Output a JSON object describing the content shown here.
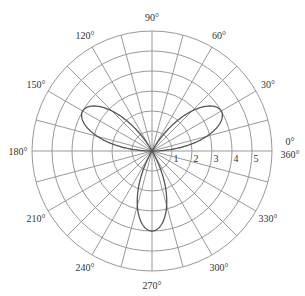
{
  "chart_data": {
    "type": "line",
    "subtype": "polar",
    "title": "",
    "equation": "r = 4 sin(3θ)",
    "series": [
      {
        "name": "rose curve",
        "petals": 3,
        "amplitude": 4,
        "petal_angles_deg": [
          30,
          150,
          270
        ],
        "color": "#555555"
      }
    ],
    "angular_axis": {
      "tick_step_deg": 15,
      "labels": [
        {
          "angle": 0,
          "text": "0°"
        },
        {
          "angle": 0,
          "text": "360°"
        },
        {
          "angle": 30,
          "text": "30°"
        },
        {
          "angle": 60,
          "text": "60°"
        },
        {
          "angle": 90,
          "text": "90°"
        },
        {
          "angle": 120,
          "text": "120°"
        },
        {
          "angle": 150,
          "text": "150°"
        },
        {
          "angle": 180,
          "text": "180°"
        },
        {
          "angle": 210,
          "text": "210°"
        },
        {
          "angle": 240,
          "text": "240°"
        },
        {
          "angle": 270,
          "text": "270°"
        },
        {
          "angle": 300,
          "text": "300°"
        },
        {
          "angle": 330,
          "text": "330°"
        }
      ]
    },
    "radial_axis": {
      "rmax": 6,
      "ticks": [
        1,
        2,
        3,
        4,
        5
      ],
      "labels": [
        "1",
        "2",
        "3",
        "4",
        "5"
      ]
    },
    "grid": true,
    "colors": {
      "grid": "#999999",
      "curve": "#555555",
      "text": "#333333"
    }
  }
}
